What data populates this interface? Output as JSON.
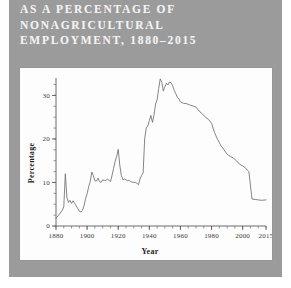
{
  "page": {
    "background_color": "#9b9b9b",
    "panel_color": "#fdfdfd"
  },
  "title": {
    "line1": "AS A PERCENTAGE OF",
    "line2": "NONAGRICULTURAL",
    "line3": "EMPLOYMENT, 1880–2015",
    "color": "#f2f2f2"
  },
  "chart_data": {
    "type": "line",
    "title": "",
    "xlabel": "Year",
    "ylabel": "Percentage",
    "xlim": [
      1880,
      2015
    ],
    "ylim": [
      0,
      34
    ],
    "grid": false,
    "legend": "none",
    "line_color": "#6f6f6f",
    "xticks": [
      1880,
      1900,
      1920,
      1940,
      1960,
      1980,
      2000,
      2015
    ],
    "xtick_labels": [
      "1880",
      "1900",
      "1920",
      "1940",
      "1960",
      "1980",
      "2000",
      "2015"
    ],
    "xminor_step": 5,
    "yticks": [
      0,
      10,
      20,
      30
    ],
    "ytick_labels": [
      "0",
      "10",
      "20",
      "30"
    ],
    "yminor_step": 2.5,
    "series": [
      {
        "name": "Union membership share",
        "x": [
          1880,
          1882,
          1884,
          1885,
          1886,
          1887,
          1888,
          1889,
          1890,
          1891,
          1892,
          1893,
          1894,
          1895,
          1896,
          1897,
          1898,
          1899,
          1900,
          1901,
          1902,
          1903,
          1904,
          1905,
          1906,
          1907,
          1908,
          1909,
          1910,
          1911,
          1912,
          1913,
          1914,
          1915,
          1916,
          1917,
          1918,
          1919,
          1920,
          1921,
          1922,
          1923,
          1924,
          1925,
          1926,
          1927,
          1928,
          1929,
          1930,
          1931,
          1932,
          1933,
          1934,
          1935,
          1936,
          1937,
          1938,
          1939,
          1940,
          1941,
          1942,
          1943,
          1944,
          1945,
          1946,
          1947,
          1948,
          1949,
          1950,
          1951,
          1952,
          1953,
          1954,
          1955,
          1956,
          1957,
          1958,
          1959,
          1960,
          1962,
          1964,
          1966,
          1968,
          1970,
          1972,
          1974,
          1976,
          1978,
          1980,
          1982,
          1984,
          1986,
          1988,
          1990,
          1992,
          1994,
          1996,
          1998,
          2000,
          2002,
          2003,
          2004,
          2006,
          2008,
          2010,
          2012,
          2015
        ],
        "y": [
          1.8,
          2.6,
          3.6,
          4.4,
          12.0,
          6.6,
          5.4,
          5.9,
          5.2,
          5.8,
          5.2,
          4.6,
          4.0,
          3.4,
          3.2,
          3.6,
          4.6,
          6.3,
          7.4,
          9.0,
          10.2,
          12.4,
          11.6,
          10.4,
          10.3,
          11.0,
          10.2,
          10.0,
          10.6,
          10.5,
          10.4,
          10.8,
          10.5,
          10.2,
          11.6,
          13.2,
          14.8,
          16.0,
          17.6,
          14.0,
          11.6,
          10.6,
          10.8,
          10.6,
          10.4,
          10.5,
          10.2,
          10.1,
          10.0,
          10.0,
          9.8,
          9.5,
          10.8,
          11.6,
          12.2,
          20.0,
          22.5,
          23.0,
          24.2,
          25.4,
          23.8,
          25.5,
          28.0,
          29.0,
          31.6,
          33.8,
          33.0,
          31.0,
          32.0,
          32.8,
          32.4,
          33.1,
          32.9,
          32.2,
          31.2,
          30.4,
          29.6,
          29.2,
          28.5,
          28.2,
          28.1,
          27.8,
          27.6,
          27.3,
          26.4,
          25.8,
          25.0,
          24.5,
          23.6,
          21.4,
          19.8,
          18.5,
          17.5,
          16.5,
          16.0,
          15.6,
          15.0,
          14.2,
          13.8,
          13.3,
          12.8,
          12.5,
          6.2,
          6.1,
          6.0,
          5.9,
          6.0
        ]
      }
    ]
  }
}
